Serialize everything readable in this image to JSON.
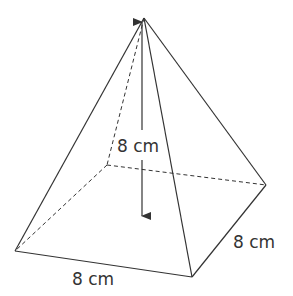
{
  "diagram": {
    "type": "square-based pyramid",
    "labels": {
      "height": "8 cm",
      "right_edge": "8 cm",
      "front_edge": "8 cm"
    },
    "colors": {
      "stroke": "#333333",
      "background": "#ffffff"
    }
  }
}
